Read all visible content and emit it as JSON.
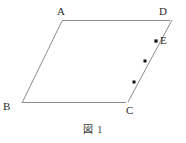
{
  "figure": {
    "caption": "図 1",
    "stroke_color": "#8d8d8d",
    "label_color": "#2b2b2b",
    "marker_color": "#111111",
    "background_color": "#ffffff",
    "labels": {
      "A": "A",
      "B": "B",
      "C": "C",
      "D": "D",
      "E": "E"
    },
    "vertices": [
      {
        "name": "A",
        "x": 62,
        "y": 21
      },
      {
        "name": "D",
        "x": 172,
        "y": 20
      },
      {
        "name": "C",
        "x": 128,
        "y": 102
      },
      {
        "name": "B",
        "x": 22,
        "y": 103
      }
    ],
    "edges": [
      {
        "name": "AD",
        "x1": 62,
        "y1": 21,
        "x2": 172,
        "y2": 20
      },
      {
        "name": "DC",
        "x1": 172,
        "y1": 20,
        "x2": 128,
        "y2": 102
      },
      {
        "name": "CB",
        "x1": 128,
        "y1": 102,
        "x2": 22,
        "y2": 103
      },
      {
        "name": "BA",
        "x1": 22,
        "y1": 103,
        "x2": 62,
        "y2": 21
      }
    ],
    "points_on_dc": [
      {
        "name": "E",
        "x": 156,
        "y": 41,
        "size": 3.2
      },
      {
        "name": "point-2",
        "x": 145,
        "y": 61,
        "size": 3.0
      },
      {
        "name": "point-3",
        "x": 134,
        "y": 82,
        "size": 3.0
      }
    ]
  }
}
